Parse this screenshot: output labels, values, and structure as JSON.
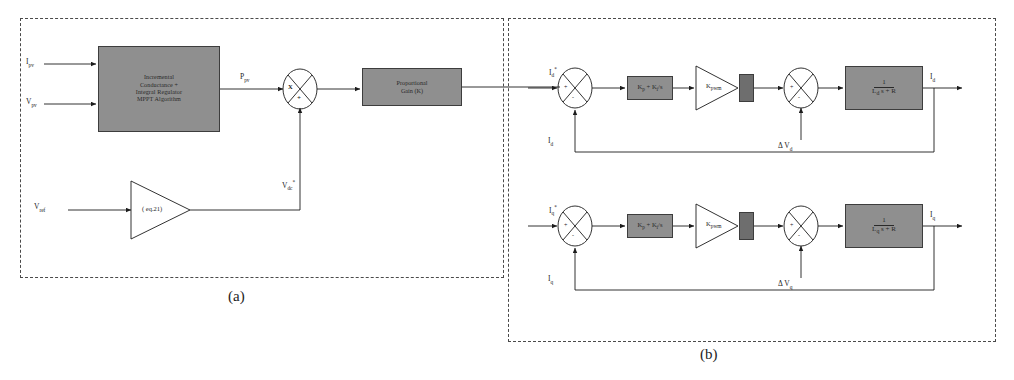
{
  "figure": {
    "panels": [
      {
        "id": "a",
        "caption": "(a)"
      },
      {
        "id": "b",
        "caption": "(b)"
      }
    ]
  },
  "panel_a": {
    "inputs": [
      {
        "name": "ipv-input-label",
        "text": "I",
        "sub": "pv"
      },
      {
        "name": "vpv-input-label",
        "text": "V",
        "sub": "pv"
      },
      {
        "name": "vref-input-label",
        "text": "V",
        "sub": "ref"
      }
    ],
    "mppt_block": {
      "lines": [
        "Incremental",
        "Conductance +",
        "Integral Regulator",
        "MPPT Algorithm"
      ]
    },
    "signals": {
      "ppv_label": "P",
      "ppv_sub": "pv",
      "vdc_label": "V",
      "vdc_sub": "dc",
      "vdc_sup": "*"
    },
    "multiplier": {
      "name": "multiplier-junction",
      "left_sign": "X",
      "bottom_sign": "+"
    },
    "amplifier": {
      "name": "equation-amplifier",
      "label": "( eq.21)"
    },
    "gain_block": {
      "lines": [
        "Proportional",
        "Gain (K)"
      ]
    }
  },
  "panel_b": {
    "loops": [
      {
        "id": "d-axis",
        "reference_label": "I",
        "reference_sub": "d",
        "reference_sup": "*",
        "feedback_label": "I",
        "feedback_sub": "d",
        "sum_plus": "+",
        "sum_minus": "-",
        "pi_controller": "K  + K /s",
        "pi_kp": "K",
        "pi_kp_sub": "p",
        "pi_ki": "K",
        "pi_ki_sub": "i",
        "pwm_gain": "K",
        "pwm_gain_sub": "pwm",
        "limiter": "",
        "disturbance_label": "Δ V",
        "disturbance_sub": "d",
        "disturbance_sum_plus": "+",
        "disturbance_sum_minus": "-",
        "plant_num": "1",
        "plant_den": "L  s + R",
        "plant_den_sub": "d",
        "output_label": "I",
        "output_sub": "d"
      },
      {
        "id": "q-axis",
        "reference_label": "I",
        "reference_sub": "q",
        "reference_sup": "*",
        "feedback_label": "I",
        "feedback_sub": "q",
        "sum_plus": "+",
        "sum_minus": "-",
        "pi_controller": "K  + K /s",
        "pi_kp": "K",
        "pi_kp_sub": "p",
        "pi_ki": "K",
        "pi_ki_sub": "i",
        "pwm_gain": "K",
        "pwm_gain_sub": "pwm",
        "limiter": "",
        "disturbance_label": "Δ V",
        "disturbance_sub": "q",
        "disturbance_sum_plus": "+",
        "disturbance_sum_minus": "-",
        "plant_num": "1",
        "plant_den": "L  s + R",
        "plant_den_sub": "q",
        "output_label": "I",
        "output_sub": "q"
      }
    ]
  },
  "colors": {
    "block_fill": "#8f8f8f",
    "limiter_fill": "#6e6e6e",
    "stroke": "#2a2a2a",
    "panel_border": "#4a4a4a",
    "background": "#ffffff"
  }
}
